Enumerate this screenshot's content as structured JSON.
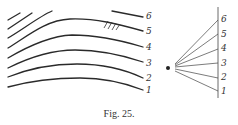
{
  "figure": {
    "caption": "Fig. 25.",
    "left_panel": {
      "description": "Family of curved lines (isolines) labelled 1-6",
      "labels": [
        "6",
        "5",
        "4",
        "3",
        "2",
        "1"
      ]
    },
    "right_panel": {
      "description": "Pencil of rays from a point to a vertical line, labelled 1-6",
      "labels": [
        "6",
        "5",
        "4",
        "3",
        "2",
        "1"
      ]
    }
  }
}
